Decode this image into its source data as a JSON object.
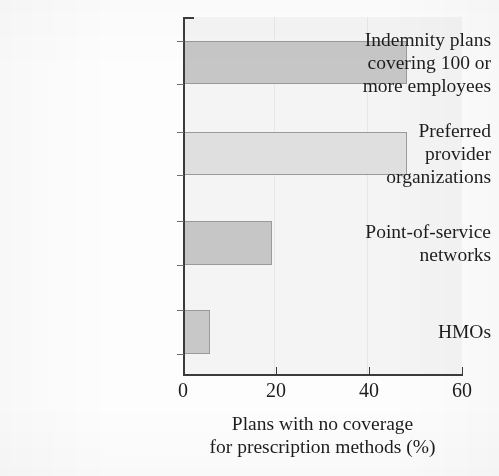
{
  "chart_data": {
    "type": "bar",
    "orientation": "horizontal",
    "title": "",
    "xlabel_line1": "Plans with no coverage",
    "xlabel_line2": "for prescription methods (%)",
    "ylabel": "",
    "categories": [
      "Indemnity plans covering 100 or more employees",
      "Preferred provider organizations",
      "Point-of-service networks",
      "HMOs"
    ],
    "category_lines": [
      [
        "Indemnity plans",
        "covering 100 or",
        "more employees"
      ],
      [
        "Preferred",
        "provider",
        "organizations"
      ],
      [
        "Point-of-service",
        "networks"
      ],
      [
        "HMOs"
      ]
    ],
    "values": [
      48,
      48,
      19,
      5.5
    ],
    "xlim": [
      0,
      60
    ],
    "xticks": [
      0,
      20,
      40,
      60
    ],
    "xtick_labels": [
      "0",
      "20",
      "40",
      "60"
    ],
    "grid": "vertical-faint",
    "legend": "none",
    "bar_colors": [
      "#c6c6c6",
      "#dfdfdf",
      "#c6c6c6",
      "#c8c8c8"
    ],
    "bar_border_color": "#9a9a9a",
    "axis_color": "#3b3b3b",
    "plot_background": "#f4f4f4",
    "page_background": "#fdfdfd"
  }
}
